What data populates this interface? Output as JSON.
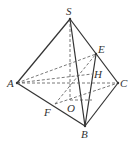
{
  "figure": {
    "type": "tetrahedron",
    "points": {
      "S": {
        "label": "S",
        "x": 70,
        "y": 19
      },
      "A": {
        "label": "A",
        "x": 17,
        "y": 83
      },
      "B": {
        "label": "B",
        "x": 85,
        "y": 126
      },
      "C": {
        "label": "C",
        "x": 118,
        "y": 83
      },
      "E": {
        "label": "E",
        "x": 96,
        "y": 54
      },
      "H": {
        "label": "H",
        "x": 92,
        "y": 74
      },
      "O": {
        "label": "O",
        "x": 70,
        "y": 100
      },
      "F": {
        "label": "F",
        "x": 55,
        "y": 104
      }
    },
    "solid_edges": [
      "SA",
      "SB",
      "SC",
      "AB",
      "BC",
      "EB"
    ],
    "dashed_edges": [
      "AC",
      "SO",
      "AE",
      "AH",
      "FC",
      "OH",
      "FO"
    ]
  }
}
